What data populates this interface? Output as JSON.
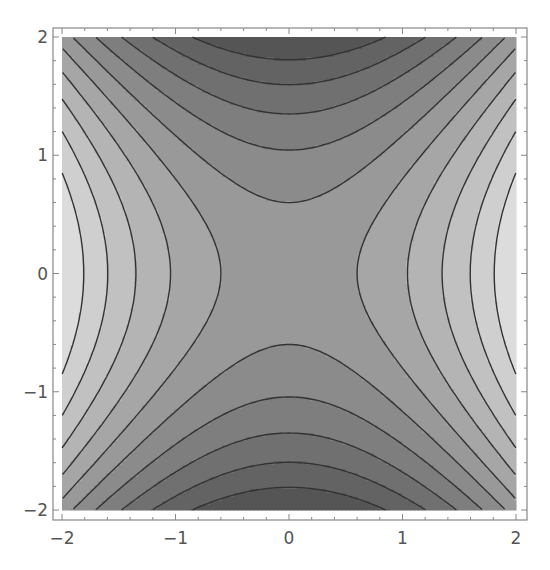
{
  "chart_data": {
    "type": "contour",
    "function": "x^2 - y^2",
    "title": "",
    "xlabel": "",
    "ylabel": "",
    "xlim": [
      -2,
      2
    ],
    "ylim": [
      -2,
      2
    ],
    "x_ticks": [
      -2,
      -1,
      0,
      1,
      2
    ],
    "y_ticks": [
      -2,
      -1,
      0,
      1,
      2
    ],
    "x_tick_labels": [
      "-2",
      "-1",
      "0",
      "1",
      "2"
    ],
    "y_tick_labels": [
      "-2",
      "-1",
      "0",
      "1",
      "2"
    ],
    "contour_levels": [
      -3.27,
      -2.55,
      -1.82,
      -1.09,
      -0.36,
      0.36,
      1.09,
      1.82,
      2.55,
      3.27
    ],
    "value_range": [
      -4,
      4
    ],
    "contour_crossings_y0": [
      -1.86,
      -1.64,
      -1.37,
      -0.63,
      0.63,
      1.09,
      1.39,
      1.66,
      1.87
    ],
    "contour_crossings_x0": [
      1.69,
      1.39,
      1.08,
      0.66,
      -0.66,
      -1.08,
      -1.39,
      -1.69
    ],
    "shading": "grayscale, darker = lower value",
    "shade_light": "#dcdcdc",
    "shade_dark": "#555555",
    "contour_line_color": "#333333",
    "frame_color": "#888888",
    "grid": false,
    "legend": null
  }
}
